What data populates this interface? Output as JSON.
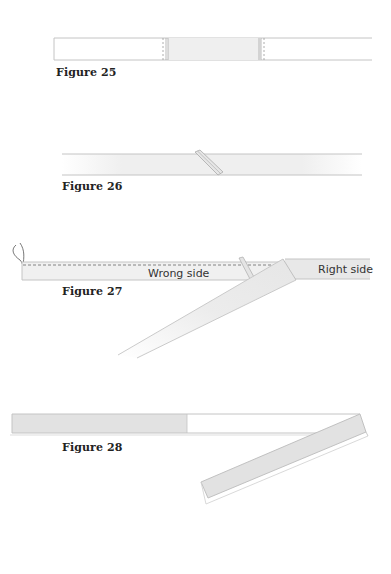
{
  "figures": [
    {
      "id": "figure-25",
      "caption": "Figure 25"
    },
    {
      "id": "figure-26",
      "caption": "Figure 26"
    },
    {
      "id": "figure-27",
      "caption": "Figure 27",
      "labels": {
        "wrong_side": "Wrong side",
        "right_side": "Right side"
      }
    },
    {
      "id": "figure-28",
      "caption": "Figure 28"
    }
  ],
  "colors": {
    "line": "#bdbdbd",
    "fabric_fill": "#ececec",
    "fabric_fill_dark": "#e2e2e2",
    "stitch": "#888888",
    "caption_text": "#222222"
  }
}
